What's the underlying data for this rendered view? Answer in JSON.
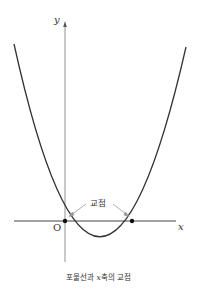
{
  "figure": {
    "caption": "포물선과 x축의 교점",
    "caption_parts": {
      "pre": "포물선과 ",
      "var": "x",
      "post": "축의 교점"
    },
    "axes": {
      "x_label": "x",
      "y_label": "y",
      "origin_label": "O"
    },
    "annotation": {
      "label": "교점"
    },
    "curve": {
      "type": "parabola",
      "opens": "up",
      "roots": [
        "O",
        "second intersection"
      ]
    },
    "colors": {
      "curve": "#333333",
      "axis": "#555555",
      "arrow": "#888888",
      "text": "#333333"
    }
  }
}
